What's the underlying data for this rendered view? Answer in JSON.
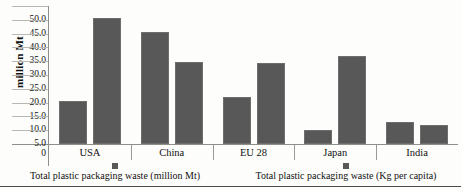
{
  "chart_data": {
    "type": "bar",
    "title": "",
    "subtitle": "",
    "xlabel": "",
    "ylabel": "million Mt",
    "ylim": [
      0,
      50
    ],
    "ytick_labels": [
      "50.0",
      "45.0",
      "40.0",
      "35.0",
      "30.0",
      "25.0",
      "20.0",
      "15.0",
      "10.0",
      "5.0",
      "0"
    ],
    "ytick_values": [
      50,
      45,
      40,
      35,
      30,
      25,
      20,
      15,
      10,
      5,
      0
    ],
    "grid": true,
    "grid_axis": "y",
    "legend_position": "bottom",
    "categories": [
      "USA",
      "China",
      "EU 28",
      "Japan",
      "India"
    ],
    "series": [
      {
        "name": "Total plastic packaging waste (million Mt)",
        "values": [
          16.5,
          42.7,
          18.0,
          5.3,
          8.4
        ],
        "color": "#585858"
      },
      {
        "name": "Total plastic packaging waste (Kg per capita)",
        "values": [
          48.0,
          31.3,
          31.0,
          33.6,
          7.3
        ],
        "color": "#585858"
      }
    ]
  },
  "axis": {
    "y_title": "million Mt",
    "zero_label": "0"
  },
  "legend": {
    "entries": [
      {
        "label": "Total plastic packaging waste (million Mt)"
      },
      {
        "label": "Total plastic packaging waste (Kg per capita)"
      }
    ]
  },
  "colors": {
    "bar_fill": "#585858",
    "bar_edge": "#6e6e6e",
    "gridline": "#b9b9b4",
    "axis": "#8f8f8a",
    "text": "#111111",
    "background": "#fdfdfb"
  }
}
